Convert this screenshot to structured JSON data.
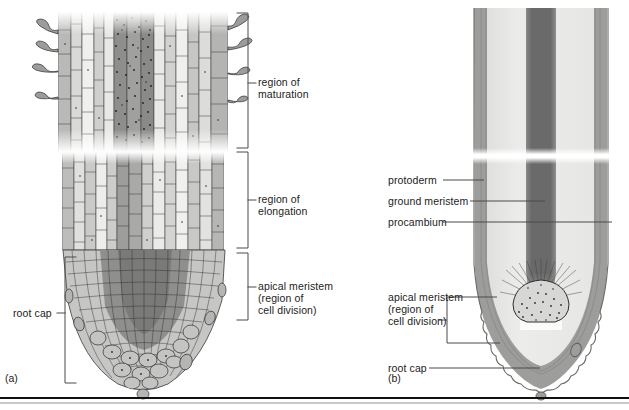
{
  "figure": {
    "panels": [
      {
        "id": "a",
        "label": "(a)",
        "caption": "cellular drawing of root tip"
      },
      {
        "id": "b",
        "label": "(b)",
        "caption": "schematic diagram of root tip tissues"
      }
    ]
  },
  "panel_a": {
    "id_label": "(a)",
    "brackets": [
      {
        "name": "region-of-maturation",
        "label_line1": "region of",
        "label_line2": "maturation",
        "label_line3": "",
        "y_top": 13,
        "y_bottom": 148
      },
      {
        "name": "region-of-elongation",
        "label_line1": "region of",
        "label_line2": "elongation",
        "label_line3": "",
        "y_top": 152,
        "y_bottom": 248
      },
      {
        "name": "apical-meristem",
        "label_line1": "apical meristem",
        "label_line2": "(region of",
        "label_line3": "cell division)",
        "y_top": 253,
        "y_bottom": 320
      }
    ],
    "left_label": {
      "name": "root-cap",
      "text": "root cap",
      "y_top": 257,
      "y_bottom": 383
    },
    "features": {
      "root_hairs": "root hairs",
      "vascular_cylinder": "vascular cylinder",
      "cortex": "cortex"
    }
  },
  "panel_b": {
    "id_label": "(b)",
    "tissue_labels": [
      {
        "name": "protoderm",
        "text": "protoderm",
        "y": 180
      },
      {
        "name": "ground-meristem",
        "text": "ground meristem",
        "y": 201
      },
      {
        "name": "procambium",
        "text": "procambium",
        "y": 222
      }
    ],
    "region_labels": [
      {
        "name": "apical-meristem",
        "line1": "apical meristem",
        "line2": "(region of",
        "line3": "cell division)",
        "y_top": 297,
        "y_bottom": 343
      },
      {
        "name": "root-cap",
        "line1": "root cap",
        "line2": "",
        "line3": "",
        "y": 368
      }
    ]
  },
  "colors": {
    "background": "#ffffff",
    "ink": "#1c1c1c",
    "leader_line": "#4a4a4a",
    "root_cap_gray": "#9a9a9a",
    "ground_meristem_gray": "#e4e4e2",
    "procambium_dark": "#6e6e6e",
    "procambium_darkest": "#5d5d5d",
    "protoderm_line": "#8e8e8e",
    "cell_outline": "#3b3b3b",
    "cell_fill_light": "#c9c9c7",
    "cell_fill_mid": "#a8a8a6",
    "cell_fill_dark": "#7b7b79",
    "baseline_rule": "#111111"
  }
}
